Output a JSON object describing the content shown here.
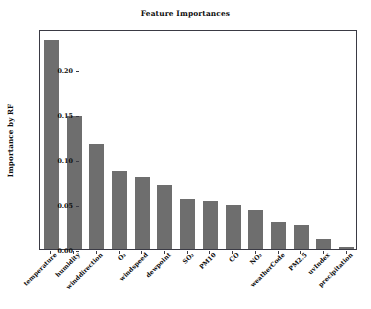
{
  "chart_data": {
    "type": "bar",
    "title": "Feature Importances",
    "xlabel": "",
    "ylabel": "Importance by RF",
    "ylim": [
      0.0,
      0.245
    ],
    "grid": false,
    "legend": null,
    "yticks": [
      "0.00",
      "0.05",
      "0.10",
      "0.15",
      "0.20"
    ],
    "ytick_values": [
      0.0,
      0.05,
      0.1,
      0.15,
      0.2
    ],
    "categories": [
      "temperature",
      "humidity",
      "winddirection",
      "O3",
      "windspeed",
      "dewpoint",
      "SO2",
      "PM10",
      "CO",
      "NO2",
      "weatherCode",
      "PM2.5",
      "uvIndex",
      "precipitation"
    ],
    "category_labels_display": [
      "temperature",
      "humidity",
      "winddirection",
      "O₃",
      "windspeed",
      "dewpoint",
      "SO₂",
      "PM10",
      "CO",
      "NO₂",
      "weatherCode",
      "PM2.5",
      "uvIndex",
      "precipitation"
    ],
    "values": [
      0.233,
      0.148,
      0.117,
      0.087,
      0.08,
      0.071,
      0.056,
      0.054,
      0.049,
      0.044,
      0.03,
      0.027,
      0.011,
      0.002
    ],
    "bar_color": "#6e6e6e",
    "axis_color": "#3a3a44",
    "background": "#ffffff"
  }
}
